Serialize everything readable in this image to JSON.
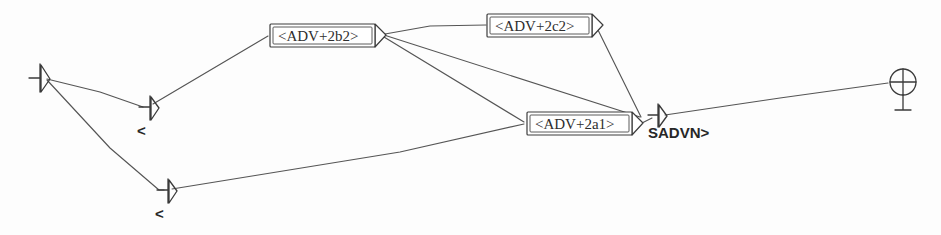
{
  "diagram": {
    "background_color": "#fdfdfd",
    "ink_color": "#3a3a3a",
    "width": 941,
    "height": 235,
    "nodes": [
      {
        "id": "root-left",
        "kind": "arrow-head-node",
        "label": "",
        "x": 40,
        "y": 77
      },
      {
        "id": "node-upper-left",
        "kind": "arrow-head-node",
        "label": "<",
        "x": 150,
        "y": 107
      },
      {
        "id": "node-lower-left",
        "kind": "arrow-head-node",
        "label": "<",
        "x": 168,
        "y": 190
      },
      {
        "id": "box-adv-2b2",
        "kind": "labeled-box",
        "label": "<ADV+2b2>",
        "x": 270,
        "y": 24,
        "width": 105,
        "height": 23
      },
      {
        "id": "box-adv-2c2",
        "kind": "labeled-box",
        "label": "<ADV+2c2>",
        "x": 487,
        "y": 14,
        "width": 105,
        "height": 23
      },
      {
        "id": "box-adv-2a1",
        "kind": "labeled-box",
        "label": "<ADV+2a1>",
        "x": 527,
        "y": 112,
        "width": 105,
        "height": 23
      },
      {
        "id": "node-sadvn",
        "kind": "arrow-head-node",
        "label": "SADVN>",
        "x": 658,
        "y": 115
      },
      {
        "id": "terminal-circle",
        "kind": "circled-cross-node",
        "label": "",
        "x": 903,
        "y": 82
      }
    ],
    "edges": [
      {
        "from": "root-left",
        "to": "node-upper-left"
      },
      {
        "from": "root-left",
        "to": "node-lower-left"
      },
      {
        "from": "node-upper-left",
        "to": "box-adv-2b2"
      },
      {
        "from": "box-adv-2b2",
        "to": "box-adv-2c2"
      },
      {
        "from": "box-adv-2b2",
        "to": "box-adv-2a1"
      },
      {
        "from": "box-adv-2b2",
        "to": "node-sadvn"
      },
      {
        "from": "box-adv-2c2",
        "to": "node-sadvn"
      },
      {
        "from": "box-adv-2a1",
        "to": "node-sadvn"
      },
      {
        "from": "node-lower-left",
        "to": "box-adv-2a1"
      },
      {
        "from": "node-sadvn",
        "to": "terminal-circle"
      }
    ]
  }
}
